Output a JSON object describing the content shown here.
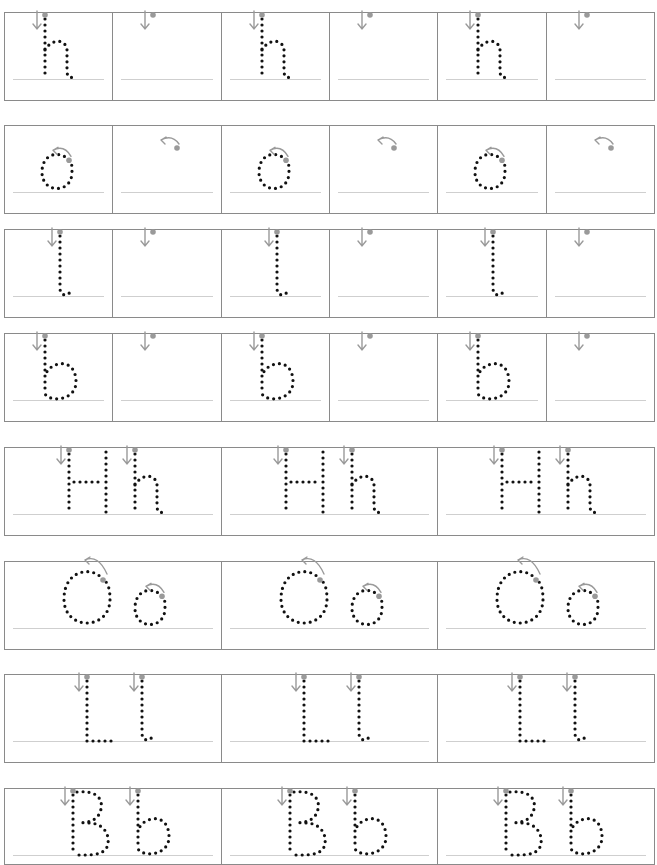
{
  "worksheet": {
    "type": "letter tracing",
    "colors": {
      "border": "#8a8a8a",
      "baseline": "#cfcfcf",
      "dots": "#111111",
      "guide_arrow": "#9a9a9a"
    },
    "single_rows": [
      {
        "letter": "h",
        "cells": [
          "traced",
          "start-only",
          "traced",
          "start-only",
          "traced",
          "start-only"
        ],
        "stroke_hint": "down-arrow"
      },
      {
        "letter": "o",
        "cells": [
          "traced",
          "start-only",
          "traced",
          "start-only",
          "traced",
          "start-only"
        ],
        "stroke_hint": "counter-clockwise-arc-arrow"
      },
      {
        "letter": "l",
        "cells": [
          "traced",
          "start-only",
          "traced",
          "start-only",
          "traced",
          "start-only"
        ],
        "stroke_hint": "down-arrow"
      },
      {
        "letter": "b",
        "cells": [
          "traced",
          "start-only",
          "traced",
          "start-only",
          "traced",
          "start-only"
        ],
        "stroke_hint": "down-arrow"
      }
    ],
    "pair_rows": [
      {
        "letters": "Hh",
        "repeat": 3,
        "stroke_hint": "down-arrow"
      },
      {
        "letters": "Oo",
        "repeat": 3,
        "stroke_hint": "counter-clockwise-arc-arrow"
      },
      {
        "letters": "Ll",
        "repeat": 3,
        "stroke_hint": "down-arrow"
      },
      {
        "letters": "Bb",
        "repeat": 3,
        "stroke_hint": "down-arrow"
      }
    ]
  }
}
